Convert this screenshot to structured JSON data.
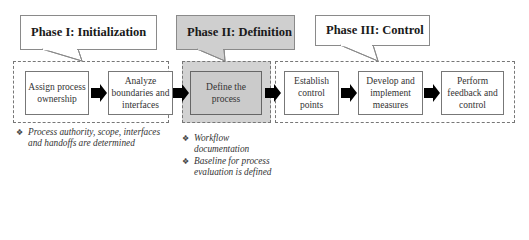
{
  "diagram": {
    "phases": [
      {
        "title": "Phase I: Initialization",
        "highlighted": false,
        "steps": [
          "Assign process ownership",
          "Analyze boundaries and interfaces"
        ],
        "notes": [
          "Process authority, scope, interfaces and handoffs are determined"
        ]
      },
      {
        "title": "Phase II: Definition",
        "highlighted": true,
        "steps": [
          "Define the process"
        ],
        "notes": [
          "Workflow documentation",
          "Baseline for process evaluation is defined"
        ]
      },
      {
        "title": "Phase III: Control",
        "highlighted": false,
        "steps": [
          "Establish control points",
          "Develop and implement measures",
          "Perform feedback and control"
        ],
        "notes": []
      }
    ],
    "bullet_glyph": "❖",
    "colors": {
      "highlight_fill": "#cfcfcf",
      "border": "#777777",
      "arrow": "#000000"
    }
  }
}
